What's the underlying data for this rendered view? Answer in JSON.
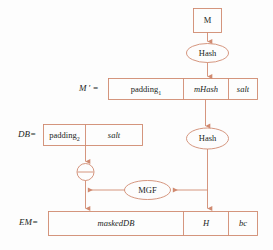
{
  "diagram": {
    "colors": {
      "stroke": "#d08a70",
      "text": "#221d1c",
      "background": "#fdfdfd"
    },
    "labels": {
      "m_prime": "M ′ =",
      "db": "DB=",
      "em": "EM="
    },
    "nodes": {
      "message": "M",
      "hash_top": "Hash",
      "hash_bottom": "Hash",
      "mgf": "MGF",
      "xor": "⊕"
    },
    "m_prime_cells": [
      {
        "label": "padding",
        "subscript": "1",
        "style": "roman"
      },
      {
        "label": "mHash",
        "subscript": "",
        "style": "ital"
      },
      {
        "label": "salt",
        "subscript": "",
        "style": "ital"
      }
    ],
    "db_cells": [
      {
        "label": "padding",
        "subscript": "2",
        "style": "roman"
      },
      {
        "label": "salt",
        "subscript": "",
        "style": "ital"
      }
    ],
    "em_cells": [
      {
        "label": "maskedDB",
        "subscript": "",
        "style": "ital"
      },
      {
        "label": "H",
        "subscript": "",
        "style": "ital"
      },
      {
        "label": "bc",
        "subscript": "",
        "style": "ital"
      }
    ]
  }
}
